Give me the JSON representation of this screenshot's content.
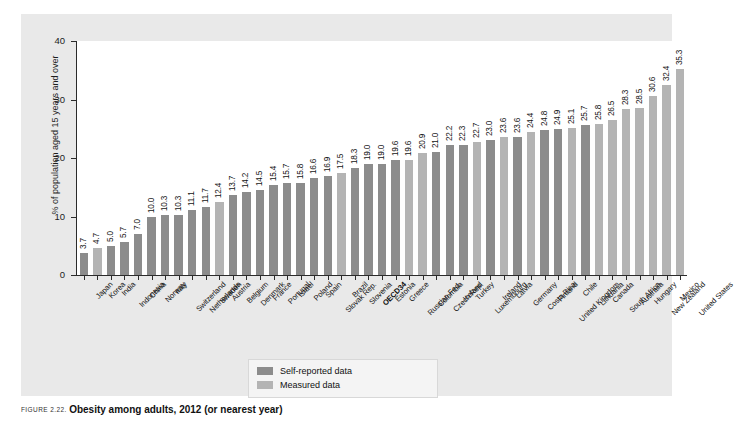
{
  "chart_data": {
    "type": "bar",
    "title": "",
    "xlabel": "",
    "ylabel": "% of population aged 15 years and over",
    "ylim": [
      0,
      40
    ],
    "yticks": [
      "0",
      "10",
      "20",
      "30",
      "40"
    ],
    "grid": false,
    "legend_position": "bottom-center",
    "series_colors": {
      "self_reported": "#8c8c8c",
      "measured": "#b4b4b4"
    },
    "legend": [
      {
        "label": "Self-reported data",
        "color": "#8c8c8c",
        "key": "self"
      },
      {
        "label": "Measured data",
        "color": "#b4b4b4",
        "key": "meas"
      }
    ],
    "categories": [
      "Japan",
      "Korea",
      "India",
      "Indonesia",
      "China",
      "Norway",
      "Italy",
      "Switzerland",
      "Netherlands",
      "Sweden",
      "Austria",
      "Belgium",
      "Denmark",
      "France",
      "Portugal",
      "Israel",
      "Poland",
      "Spain",
      "Slovak Rep.",
      "Brazil",
      "Slovenia",
      "OECD34",
      "Estonia",
      "Greece",
      "Russian Fed.",
      "Colombia",
      "Czech Rep.",
      "Iceland",
      "Turkey",
      "Luxembourg",
      "Ireland",
      "Latvia",
      "Germany",
      "Costa Rica",
      "Finland",
      "United Kingdom",
      "Chile",
      "Lithuania",
      "Canada",
      "South Africa",
      "Australia",
      "Hungary",
      "New Zealand",
      "Mexico",
      "United States"
    ],
    "values": [
      3.7,
      4.7,
      5.0,
      5.7,
      7.0,
      10.0,
      10.3,
      10.3,
      11.1,
      11.7,
      12.4,
      13.7,
      14.2,
      14.5,
      15.4,
      15.7,
      15.8,
      16.6,
      16.9,
      17.5,
      18.3,
      19.0,
      19.0,
      19.6,
      19.6,
      20.9,
      21.0,
      22.2,
      22.3,
      22.7,
      23.0,
      23.6,
      23.6,
      24.4,
      24.8,
      24.9,
      25.1,
      25.7,
      25.8,
      26.5,
      28.3,
      28.5,
      30.6,
      32.4,
      35.3
    ],
    "value_labels": [
      "3.7",
      "4.7",
      "5.0",
      "5.7",
      "7.0",
      "10.0",
      "10.3",
      "10.3",
      "11.1",
      "11.7",
      "12.4",
      "13.7",
      "14.2",
      "14.5",
      "15.4",
      "15.7",
      "15.8",
      "16.6",
      "16.9",
      "17.5",
      "18.3",
      "19.0",
      "19.0",
      "19.6",
      "19.6",
      "20.9",
      "21.0",
      "22.2",
      "22.3",
      "22.7",
      "23.0",
      "23.6",
      "23.6",
      "24.4",
      "24.8",
      "24.9",
      "25.1",
      "25.7",
      "25.8",
      "26.5",
      "28.3",
      "28.5",
      "30.6",
      "32.4",
      "35.3"
    ],
    "series_key_per_bar": [
      "self",
      "meas",
      "self",
      "self",
      "self",
      "self",
      "self",
      "self",
      "self",
      "self",
      "meas",
      "self",
      "self",
      "self",
      "self",
      "self",
      "self",
      "self",
      "self",
      "meas",
      "self",
      "self",
      "self",
      "self",
      "meas",
      "meas",
      "self",
      "self",
      "self",
      "meas",
      "self",
      "meas",
      "self",
      "meas",
      "self",
      "self",
      "meas",
      "self",
      "meas",
      "meas",
      "meas",
      "meas",
      "meas",
      "meas",
      "meas"
    ],
    "bold_categories": [
      "OECD34"
    ]
  },
  "caption": {
    "figure_number": "FIGURE 2.22.",
    "title": "Obesity among adults, 2012 (or nearest year)"
  }
}
